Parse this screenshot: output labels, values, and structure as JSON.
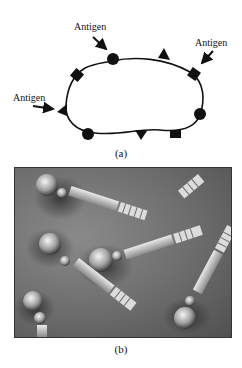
{
  "figure": {
    "panel_a": {
      "caption": "(a)",
      "labels": [
        {
          "text": "Antigen",
          "position": "top-center"
        },
        {
          "text": "Antigen",
          "position": "top-right"
        },
        {
          "text": "Antigen",
          "position": "left"
        }
      ],
      "description": "Cell outline with surface antigens (circles, squares, triangles)"
    },
    "panel_b": {
      "caption": "(b)",
      "description": "Grayscale rendering of antibody-like molecules: sphere heads, rectangular shafts, ridged ends"
    },
    "colors": {
      "line": "#111111",
      "background": "#ffffff",
      "photo_mid": "#6f6f6f"
    }
  }
}
